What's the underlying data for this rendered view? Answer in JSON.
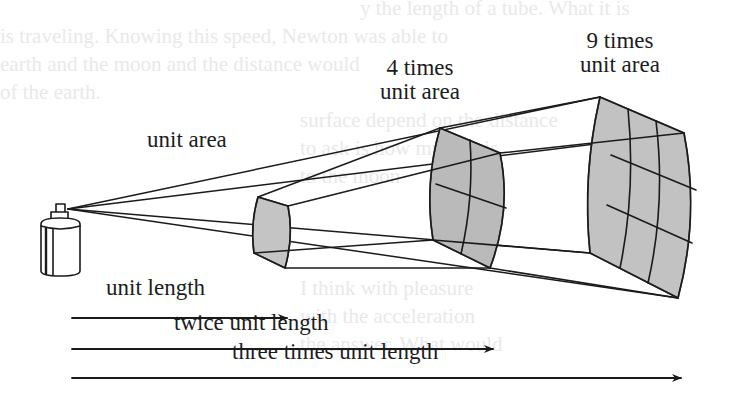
{
  "figure": {
    "source_object": "spray-can",
    "surfaces": [
      {
        "id": "surface-1",
        "label": "unit area",
        "grid": [
          1,
          1
        ],
        "distance_multiple": 1,
        "area_multiple": 1
      },
      {
        "id": "surface-2",
        "label_line1": "4 times",
        "label_line2": "unit area",
        "grid": [
          2,
          2
        ],
        "distance_multiple": 2,
        "area_multiple": 4
      },
      {
        "id": "surface-3",
        "label_line1": "9 times",
        "label_line2": "unit area",
        "grid": [
          3,
          3
        ],
        "distance_multiple": 3,
        "area_multiple": 9
      }
    ],
    "arrows": [
      {
        "id": "arrow-1",
        "label": "unit length",
        "multiple": 1
      },
      {
        "id": "arrow-2",
        "label": "twice unit length",
        "multiple": 2
      },
      {
        "id": "arrow-3",
        "label": "three times unit length",
        "multiple": 3
      }
    ],
    "colors": {
      "line": "#1a1a1a",
      "surface_fill": "#b9b9b9",
      "surface_fill_light": "#cfcfcf",
      "background": "#ffffff",
      "bleed_through_text": "#e9e9e9"
    }
  }
}
